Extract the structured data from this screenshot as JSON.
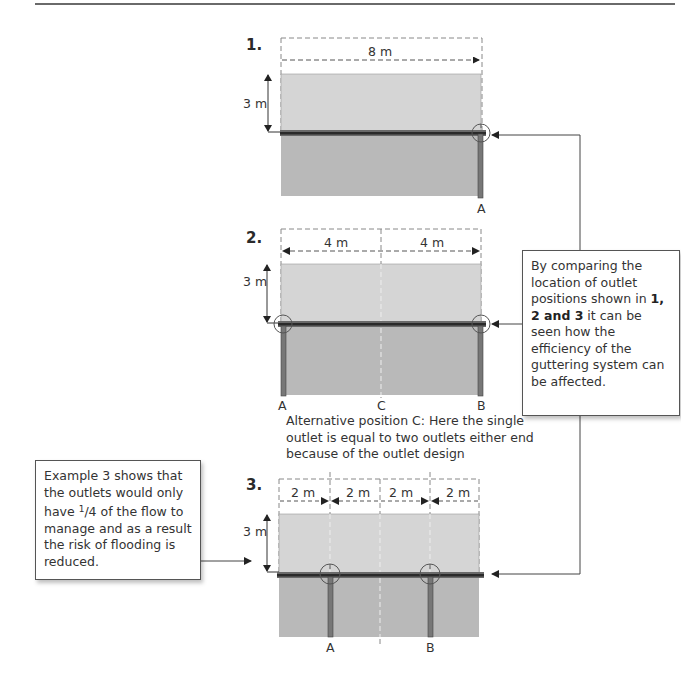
{
  "diagrams": [
    {
      "number": "1.",
      "width_label": "8 m",
      "height_label": "3 m",
      "outlet_labels": [
        "A"
      ]
    },
    {
      "number": "2.",
      "width_labels": [
        "4 m",
        "4 m"
      ],
      "height_label": "3 m",
      "outlet_labels": [
        "A",
        "C",
        "B"
      ]
    },
    {
      "number": "3.",
      "width_labels": [
        "2 m",
        "2 m",
        "2 m",
        "2 m"
      ],
      "height_label": "3 m",
      "outlet_labels": [
        "A",
        "B"
      ]
    }
  ],
  "alternative_note": "Alternative position C: Here the single outlet is equal to two outlets either end because of the outlet design",
  "callout_right": {
    "text_before": "By comparing the location of outlet positions shown in ",
    "bold": "1, 2 and 3",
    "text_after": " it can be seen how the efficiency of the guttering system can be affected."
  },
  "callout_left": {
    "text_before": "Example 3 shows that the outlets would only have ",
    "fraction_num": "1",
    "fraction_den": "/4",
    "text_after": " of the flow to manage and as a result the risk of flooding is reduced."
  },
  "colors": {
    "roof": "#d5d5d5",
    "wall": "#b9b9b9",
    "gutter": "#3a3a3a",
    "line": "#444444"
  }
}
